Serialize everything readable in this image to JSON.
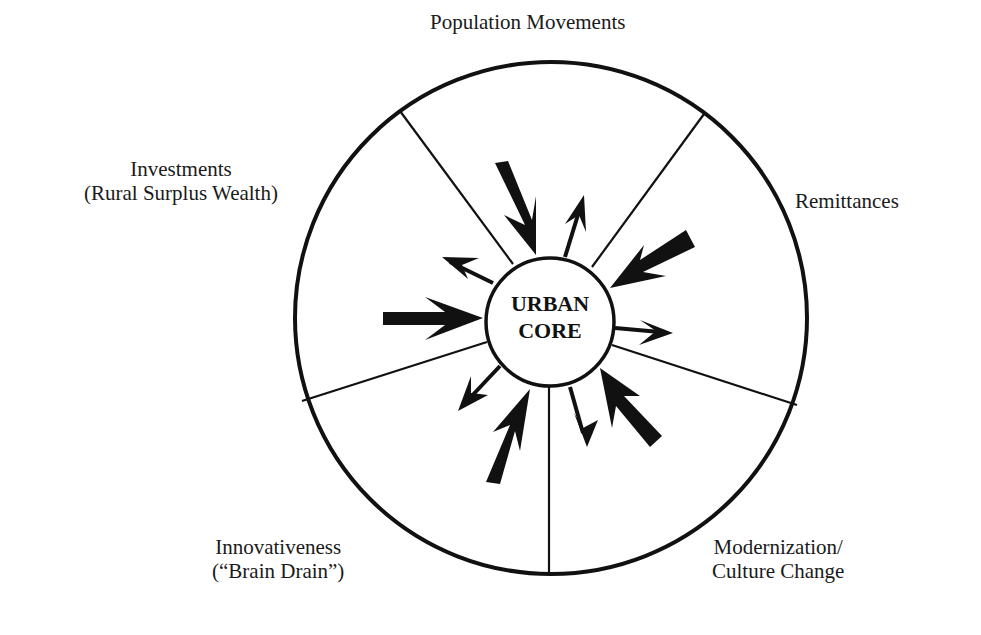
{
  "diagram": {
    "center": {
      "line1": "URBAN",
      "line2": "CORE"
    },
    "sectors": [
      {
        "id": "population",
        "label": "Population Movements"
      },
      {
        "id": "remittances",
        "label": "Remittances"
      },
      {
        "id": "modernization",
        "line1": "Modernization/",
        "line2": "Culture Change"
      },
      {
        "id": "innovativeness",
        "line1": "Innovativeness",
        "line2": "(“Brain Drain”)"
      },
      {
        "id": "investments",
        "line1": "Investments",
        "line2": "(Rural Surplus Wealth)"
      }
    ],
    "colors": {
      "ink": "#111111",
      "background": "#ffffff"
    }
  }
}
